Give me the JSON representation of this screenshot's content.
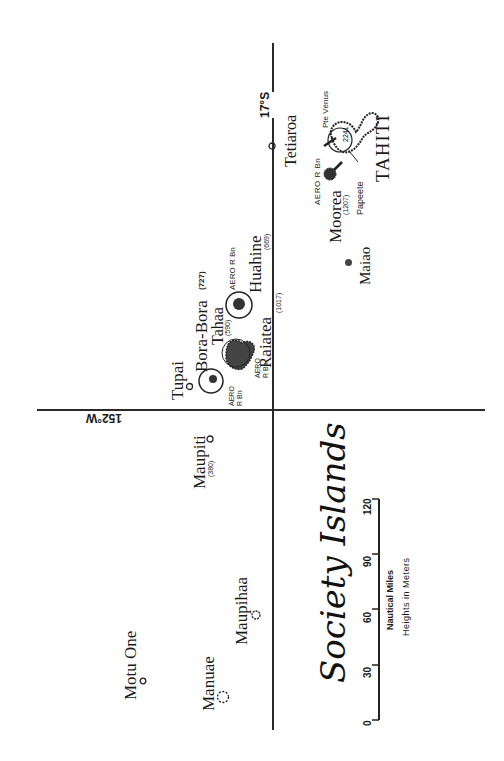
{
  "map": {
    "title": "Society Islands",
    "latitude_label": "17°S",
    "longitude_label": "152°W",
    "scale": {
      "ticks": [
        "0",
        "30",
        "60",
        "90",
        "120"
      ],
      "unit_label": "Nautical Miles",
      "heights_note": "Heights in Meters"
    },
    "islands": [
      {
        "name": "Motu One"
      },
      {
        "name": "Manuae"
      },
      {
        "name": "Maupihaa"
      },
      {
        "name": "Maupiti",
        "height": "(380)"
      },
      {
        "name": "Tupai"
      },
      {
        "name": "Bora-Bora",
        "height": "(727)",
        "note": "AERO R Bn"
      },
      {
        "name": "Tahaa",
        "height": "(590)"
      },
      {
        "name": "Raiatea",
        "height": "(1017)",
        "note": "AERO R Bn"
      },
      {
        "name": "Huahine",
        "height": "(669)",
        "note": "AERO R Bn"
      },
      {
        "name": "Tetiaroa"
      },
      {
        "name": "Maiao"
      },
      {
        "name": "Moorea",
        "height": "(1207)",
        "note": "AERO R Bn"
      },
      {
        "name": "TAHITI",
        "height": "2241"
      }
    ],
    "places": {
      "papeete": "Papeete",
      "pte_venus": "Pte Vénus"
    },
    "colors": {
      "ink": "#1a1a1a",
      "background": "#ffffff"
    }
  }
}
